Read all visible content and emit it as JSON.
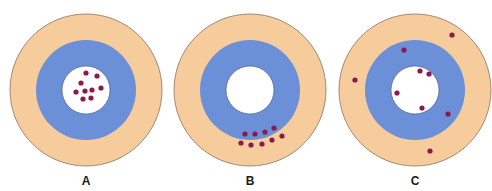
{
  "colors": {
    "outer_ring": "#F6CC9C",
    "outer_stroke": "#8A7260",
    "middle_ring": "#6B90D8",
    "bullseye": "#FFFFFF",
    "bullseye_stroke": "#3E4F7A",
    "dot": "#8B1A4A",
    "label": "#1a1a1a"
  },
  "geometry": {
    "outer_radius": 76,
    "middle_radius": 50,
    "inner_radius": 24,
    "dot_radius": 2.6
  },
  "targets": [
    {
      "label": "A",
      "center": [
        86,
        90
      ],
      "dots": [
        [
          86,
          73
        ],
        [
          97,
          76
        ],
        [
          81,
          83
        ],
        [
          76,
          92
        ],
        [
          85,
          91
        ],
        [
          92,
          90
        ],
        [
          101,
          88
        ],
        [
          83,
          99
        ],
        [
          91,
          98
        ]
      ]
    },
    {
      "label": "B",
      "center": [
        250,
        90
      ],
      "dots": [
        [
          245,
          134
        ],
        [
          255,
          134
        ],
        [
          265,
          132
        ],
        [
          274,
          128
        ],
        [
          241,
          143
        ],
        [
          251,
          145
        ],
        [
          262,
          144
        ],
        [
          272,
          140
        ],
        [
          282,
          136
        ]
      ]
    },
    {
      "label": "C",
      "center": [
        415,
        90
      ],
      "dots": [
        [
          452,
          35
        ],
        [
          404,
          50
        ],
        [
          355,
          80
        ],
        [
          420,
          71
        ],
        [
          429,
          74
        ],
        [
          397,
          93
        ],
        [
          422,
          108
        ],
        [
          448,
          114
        ],
        [
          430,
          151
        ]
      ]
    }
  ]
}
